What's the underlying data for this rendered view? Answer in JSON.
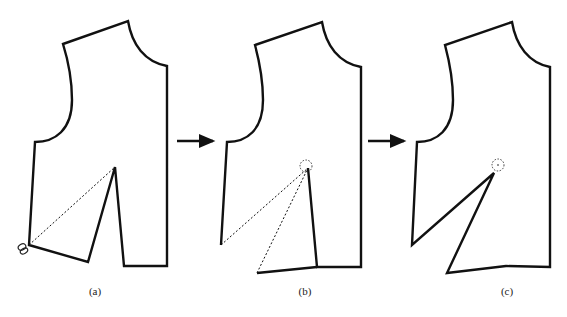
{
  "diagram": {
    "arrow_count": 2,
    "colors": {
      "line": "#111111",
      "background": "#ffffff"
    },
    "panels": [
      {
        "id": "a",
        "label": "(a)",
        "icon": "scissors-icon",
        "dashed_line": "cut line from side seam to dart apex"
      },
      {
        "id": "b",
        "label": "(b)",
        "icon": "pivot-circle",
        "dashed_line": "piece rotated about apex"
      },
      {
        "id": "c",
        "label": "(c)",
        "icon": "pivot-circle",
        "dashed_line": "none"
      }
    ]
  }
}
